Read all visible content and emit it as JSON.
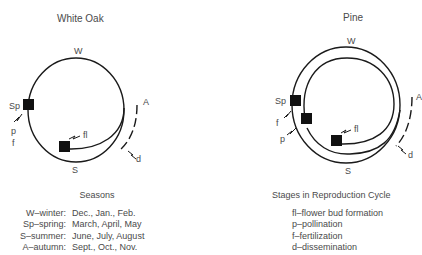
{
  "diagrams": [
    {
      "title": "White Oak",
      "labels": {
        "winter": "W",
        "spring": "Sp",
        "summer": "S",
        "autumn": "A"
      },
      "stages": {
        "pollination": "p",
        "fertilization": "f",
        "flower_bud": "fl",
        "dissemination": "d"
      }
    },
    {
      "title": "Pine",
      "labels": {
        "winter": "W",
        "spring": "Sp",
        "summer": "S",
        "autumn": "A"
      },
      "stages": {
        "pollination": "p",
        "fertilization": "f",
        "flower_bud": "fl",
        "dissemination": "d"
      }
    }
  ],
  "seasons_legend": {
    "title": "Seasons",
    "items": [
      {
        "key": "W–winter:",
        "months": "Dec., Jan., Feb."
      },
      {
        "key": "Sp–spring:",
        "months": "March, April, May"
      },
      {
        "key": "S–summer:",
        "months": "June, July, August"
      },
      {
        "key": "A–autumn:",
        "months": "Sept., Oct., Nov."
      }
    ]
  },
  "stages_legend": {
    "title": "Stages in Reproduction Cycle",
    "items": [
      "fl–flower bud formation",
      "p–pollination",
      "f–fertilization",
      "d–dissemination"
    ]
  },
  "colors": {
    "line": "#1a1a1a",
    "text": "#4a4a4a",
    "marker": "#111111"
  }
}
